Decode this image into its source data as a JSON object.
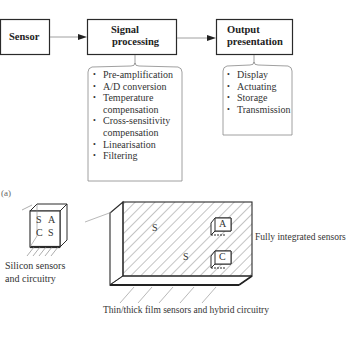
{
  "flow": {
    "sensor": "Sensor",
    "signal_processing": {
      "line1": "Signal",
      "line2": "processing",
      "items": [
        {
          "label": "Pre-amplification"
        },
        {
          "label": "A/D conversion"
        },
        {
          "label": "Temperature",
          "cont": "compensation"
        },
        {
          "label": "Cross-sensitivity",
          "cont": "compensation"
        },
        {
          "label": "Linearisation"
        },
        {
          "label": "Filtering"
        }
      ]
    },
    "output_presentation": {
      "line1": "Output",
      "line2": "presentation",
      "items": [
        {
          "label": "Display"
        },
        {
          "label": "Actuating"
        },
        {
          "label": "Storage"
        },
        {
          "label": "Transmission"
        }
      ]
    }
  },
  "panel_label": "(a)",
  "silicon_chip": {
    "letters": [
      "S",
      "A",
      "C",
      "S"
    ],
    "caption_line1": "Silicon sensors",
    "caption_line2": "and circuitry"
  },
  "substrate": {
    "s_labels": [
      "S",
      "S"
    ],
    "chip_a": "A",
    "chip_c": "C",
    "right_caption": "Fully integrated sensors",
    "bottom_caption": "Thin/thick film sensors and hybrid circuitry"
  },
  "colors": {
    "line": "#2a2a2a",
    "thin_line": "#888888",
    "background": "#ffffff"
  }
}
